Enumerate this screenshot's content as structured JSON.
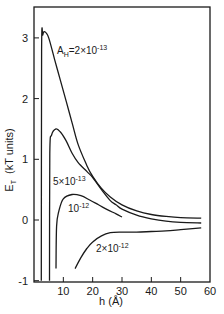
{
  "chart_data": {
    "type": "line",
    "title": "",
    "xlabel": "h (Å)",
    "ylabel": "E_T (kT units)",
    "ylabel_main": "E",
    "ylabel_sub": "T",
    "ylabel_units": "(kT units)",
    "xlim": [
      0,
      60
    ],
    "ylim": [
      -1,
      3.5
    ],
    "grid": false,
    "legend": "none (curves labeled inline)",
    "x_ticks": [
      10,
      20,
      30,
      40,
      50,
      60
    ],
    "x_tick_labels": [
      "10",
      "20",
      "30",
      "40",
      "50",
      "60"
    ],
    "y_ticks": [
      -1,
      0,
      1,
      2,
      3
    ],
    "y_tick_labels": [
      "-1",
      "0",
      "1",
      "2",
      "3"
    ],
    "series": [
      {
        "name": "A_H = 2×10^-13",
        "label_main": "A",
        "label_sub": "H",
        "label_rest": "=2×10",
        "label_exp": "-13",
        "x": [
          2.5,
          2.6,
          3.0,
          3.7,
          5.0,
          7.0,
          9.0,
          11.0,
          13.0,
          15.0,
          18.0,
          20.0,
          23.0,
          26.0,
          30.0,
          35.0,
          40.0,
          45.0,
          50.0,
          57.0
        ],
        "y": [
          -1.0,
          2.8,
          3.05,
          3.1,
          3.0,
          2.65,
          2.3,
          1.95,
          1.6,
          1.25,
          0.9,
          0.72,
          0.52,
          0.38,
          0.25,
          0.15,
          0.09,
          0.06,
          0.04,
          0.03
        ]
      },
      {
        "name": "5×10^-13",
        "label_rest": "5×10",
        "label_exp": "-13",
        "x": [
          5.3,
          5.4,
          6.0,
          7.5,
          9.0,
          11.0,
          13.0,
          15.0,
          18.0,
          20.0,
          23.0,
          26.0,
          28.0,
          30.0,
          35.0,
          40.0,
          45.0,
          50.0,
          57.0
        ],
        "y": [
          -1.0,
          1.1,
          1.4,
          1.5,
          1.45,
          1.3,
          1.1,
          0.95,
          0.8,
          0.7,
          0.5,
          0.32,
          0.25,
          0.18,
          0.08,
          0.02,
          -0.02,
          -0.04,
          -0.05
        ]
      },
      {
        "name": "10^-12",
        "label_rest": "10",
        "label_exp": "-12",
        "x": [
          7.5,
          7.7,
          8.5,
          10.0,
          13.0,
          16.0,
          19.0,
          22.0,
          25.0,
          28.0,
          30.0
        ],
        "y": [
          -0.8,
          -0.1,
          0.15,
          0.35,
          0.42,
          0.4,
          0.33,
          0.25,
          0.17,
          0.1,
          0.05
        ]
      },
      {
        "name": "2×10^-12",
        "label_rest": "2×10",
        "label_exp": "-12",
        "x": [
          14.0,
          16.0,
          18.0,
          20.0,
          23.0,
          26.0,
          30.0,
          35.0,
          40.0,
          45.0,
          50.0,
          57.0
        ],
        "y": [
          -0.8,
          -0.62,
          -0.47,
          -0.36,
          -0.26,
          -0.21,
          -0.2,
          -0.2,
          -0.19,
          -0.18,
          -0.16,
          -0.13
        ]
      }
    ]
  }
}
